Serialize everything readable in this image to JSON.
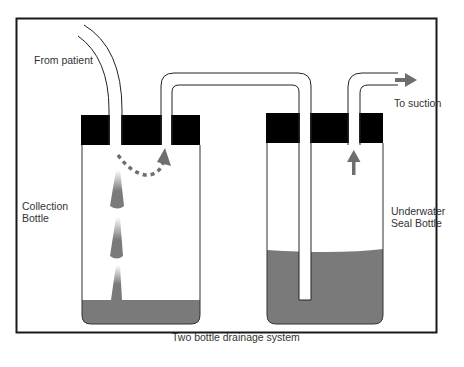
{
  "title": "Two bottle drainage system",
  "labels": {
    "from_patient": "From patient",
    "to_suction": "To suction",
    "collection_line1": "Collection",
    "collection_line2": "Bottle",
    "underwater_line1": "Underwater",
    "underwater_line2": "Seal Bottle"
  },
  "colors": {
    "frame": "#1a1a1a",
    "cap": "#000000",
    "liquid": "#7a7a7a",
    "arrow": "#6e6e6e",
    "outline": "#222222"
  },
  "components": [
    {
      "id": "collection-bottle",
      "name": "Collection Bottle"
    },
    {
      "id": "underwater-seal-bottle",
      "name": "Underwater Seal Bottle"
    },
    {
      "id": "patient-tube",
      "name": "From patient tube"
    },
    {
      "id": "connecting-tube",
      "name": "Connecting tube"
    },
    {
      "id": "suction-tube",
      "name": "To suction tube"
    }
  ]
}
